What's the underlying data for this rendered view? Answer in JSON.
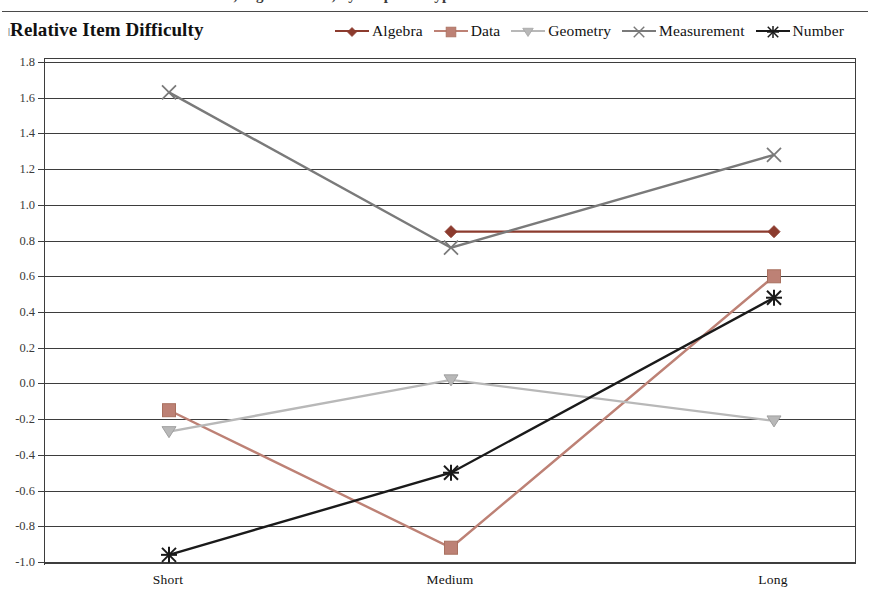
{
  "top_caption_fragment": "Mathematics, Eighth Grade, by Response Type",
  "header": {
    "title": "Relative Item Difficulty",
    "title_marker": "|"
  },
  "chart_data": {
    "type": "line",
    "title": "Relative Item Difficulty",
    "xlabel": "",
    "ylabel": "",
    "categories": [
      "Short",
      "Medium",
      "Long"
    ],
    "ylim": [
      -1.0,
      1.8
    ],
    "ytick_step": 0.2,
    "yticks": [
      "1.8",
      "1.6",
      "1.4",
      "1.2",
      "1.0",
      "0.8",
      "0.6",
      "0.4",
      "0.2",
      "0.0",
      "-0.2",
      "-0.4",
      "-0.6",
      "-0.8",
      "-1.0"
    ],
    "grid": true,
    "legend_position": "top-right",
    "series": [
      {
        "name": "Algebra",
        "color": "#8c3b2e",
        "marker": "diamond",
        "values": [
          null,
          0.85,
          0.85
        ]
      },
      {
        "name": "Data",
        "color": "#bd8175",
        "marker": "square",
        "values": [
          -0.15,
          -0.92,
          0.6
        ]
      },
      {
        "name": "Geometry",
        "color": "#b8b8b8",
        "marker": "triangle",
        "values": [
          -0.27,
          0.02,
          -0.21
        ]
      },
      {
        "name": "Measurement",
        "color": "#7a7a7a",
        "marker": "x",
        "values": [
          1.63,
          0.76,
          1.28
        ]
      },
      {
        "name": "Number",
        "color": "#1a1a1a",
        "marker": "asterisk",
        "values": [
          -0.96,
          -0.5,
          0.48
        ]
      }
    ]
  },
  "colors": {
    "axis": "#3d3d3d",
    "background": "#ffffff",
    "text": "#111111"
  }
}
